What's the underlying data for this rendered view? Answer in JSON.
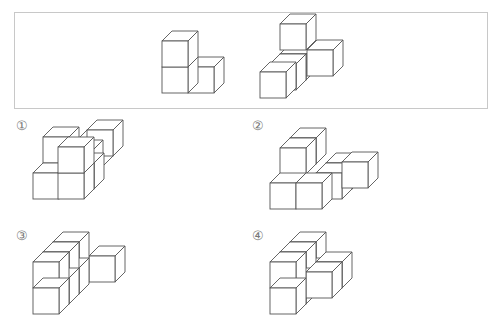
{
  "problem": {
    "given_pieces": [
      {
        "name": "piece-a",
        "cubes": 3,
        "shaded": false
      },
      {
        "name": "piece-b",
        "cubes": 4,
        "shaded_cube": true
      }
    ],
    "options": [
      {
        "label": "①",
        "index": 1
      },
      {
        "label": "②",
        "index": 2
      },
      {
        "label": "③",
        "index": 3
      },
      {
        "label": "④",
        "index": 4
      }
    ]
  },
  "colors": {
    "stroke": "#555555",
    "shaded": "#8c8c8c",
    "frame": "#c8c8c8"
  },
  "projection": {
    "unit": 26,
    "depth_dx": 10,
    "depth_dy": -10
  }
}
